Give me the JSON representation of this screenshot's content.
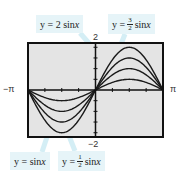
{
  "chart_data": {
    "type": "line",
    "title": "",
    "xlabel": "",
    "ylabel": "",
    "xlim": [
      "-π",
      "π"
    ],
    "xlim_values": [
      -3.14159,
      3.14159
    ],
    "ylim": [
      -2,
      2
    ],
    "x_tick_labels": {
      "min": "−π",
      "max": "π"
    },
    "y_tick_labels": {
      "max": "2",
      "min": "−2"
    },
    "x_ticks_per_side": 4,
    "y_ticks_per_side": 4,
    "grid": false,
    "series": [
      {
        "name": "y = 1/2 sin x",
        "amplitude": 0.5
      },
      {
        "name": "y = sin x",
        "amplitude": 1
      },
      {
        "name": "y = 3/2 sin x",
        "amplitude": 1.5
      },
      {
        "name": "y = 2 sin x",
        "amplitude": 2
      }
    ],
    "annotations": [
      {
        "id": "two",
        "prefix": "y = 2 sin ",
        "var": "x"
      },
      {
        "id": "three-halves",
        "prefix": "y = ",
        "num": "3",
        "den": "2",
        "suffix": " sin ",
        "var": "x"
      },
      {
        "id": "one",
        "prefix": "y = sin ",
        "var": "x"
      },
      {
        "id": "half",
        "prefix": "y = ",
        "num": "1",
        "den": "2",
        "suffix": " sin ",
        "var": "x"
      }
    ],
    "colors": {
      "plot_bg": "#e4e4e4",
      "curve": "#1a1a1a",
      "frame": "#111111",
      "callout_bg": "#e6f4f8",
      "pointer": "#d4eef5"
    }
  }
}
